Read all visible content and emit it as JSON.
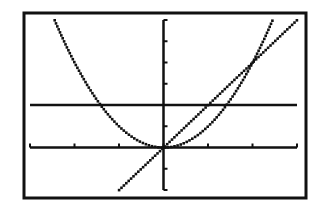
{
  "screen": {
    "frame": {
      "left": 24,
      "top": 13,
      "right": 306,
      "bottom": 198,
      "stroke": "#111111"
    },
    "plot": {
      "left": 30,
      "right": 297,
      "top": 20,
      "bottom": 190
    },
    "background": "#ffffff",
    "ink": "#111111"
  },
  "chart_data": {
    "type": "line",
    "title": "",
    "xlabel": "",
    "ylabel": "",
    "xlim": [
      -3,
      3
    ],
    "ylim": [
      -2,
      6
    ],
    "xscale_tick": 1,
    "yscale_tick": 1,
    "grid": false,
    "legend": null,
    "x_ticks": [
      -3,
      -2,
      -1,
      0,
      1,
      2,
      3
    ],
    "y_ticks": [
      -2,
      -1,
      0,
      1,
      2,
      3,
      4,
      5,
      6
    ],
    "series": [
      {
        "name": "y = x^2",
        "kind": "function",
        "expr": "x^2",
        "style": "dotted-pixel"
      },
      {
        "name": "y = 2x",
        "kind": "function",
        "expr": "2x",
        "style": "dotted-pixel"
      },
      {
        "name": "y = 2",
        "kind": "function",
        "expr": "2",
        "style": "solid"
      }
    ],
    "intersections": [
      {
        "x": -1.414,
        "y": 2
      },
      {
        "x": 0,
        "y": 0
      },
      {
        "x": 1,
        "y": 2
      },
      {
        "x": 1.414,
        "y": 2
      },
      {
        "x": 2,
        "y": 4
      }
    ]
  }
}
